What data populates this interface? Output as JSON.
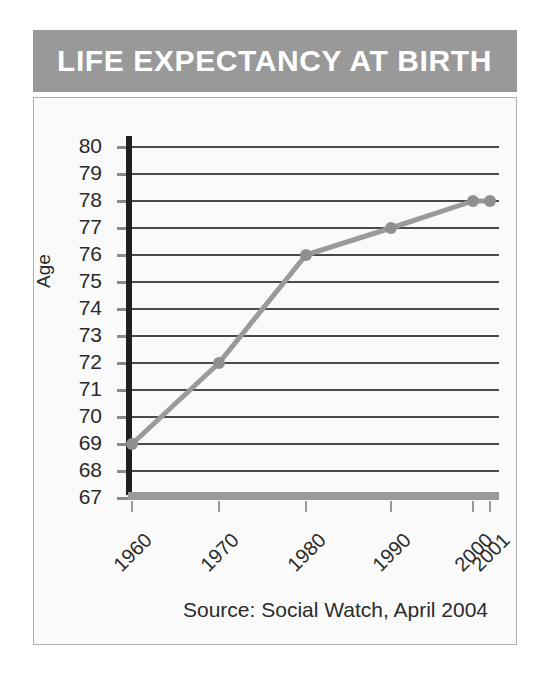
{
  "banner": {
    "title": "LIFE EXPECTANCY AT BIRTH",
    "background_color": "#999999",
    "text_color": "#ffffff"
  },
  "panel": {
    "background_color": "#fafafa",
    "border_color": "#b0b0b0"
  },
  "source_note": "Source: Social Watch, April 2004",
  "chart_data": {
    "type": "line",
    "title": "LIFE EXPECTANCY AT BIRTH",
    "xlabel": "",
    "ylabel": "Age",
    "x": [
      "1960",
      "1970",
      "1980",
      "1990",
      "2000",
      "2001"
    ],
    "values": [
      69,
      72,
      76,
      77,
      78,
      78
    ],
    "series": [
      {
        "name": "Life expectancy at birth",
        "values": [
          69,
          72,
          76,
          77,
          78,
          78
        ]
      }
    ],
    "ylim": [
      66.5,
      80.5
    ],
    "ytick_labels": [
      "80",
      "79",
      "78",
      "77",
      "76",
      "75",
      "74",
      "73",
      "72",
      "71",
      "70",
      "69",
      "68",
      "67"
    ],
    "ytick_values": [
      80,
      79,
      78,
      77,
      76,
      75,
      74,
      73,
      72,
      71,
      70,
      69,
      68,
      67
    ],
    "xtick_labels": [
      "1960",
      "1970",
      "1980",
      "1990",
      "2000",
      "2001"
    ],
    "grid": true,
    "legend": "none",
    "line_color": "#9a9a9a",
    "marker_color": "#8f8f8f",
    "gridline_color": "#4a4a4a",
    "axis_color": "#231f20"
  }
}
